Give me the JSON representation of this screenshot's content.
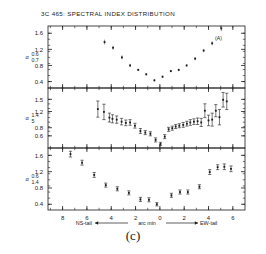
{
  "figure": {
    "title": "3C 465: SPECTRAL INDEX DISTRIBUTION",
    "caption": "(c)",
    "panel_a_label": "(A)",
    "x_axis_caption_left": "NS-tail",
    "x_axis_caption_center": "arc min",
    "x_axis_caption_right": "EW-tail",
    "ink_color": "#1b1b1b",
    "background_color": "#ffffff"
  },
  "chart_data": [
    {
      "type": "scatter",
      "panel": "A",
      "title": "3C 465: SPECTRAL INDEX DISTRIBUTION",
      "annotation": "(A)",
      "ylabel_main": "α",
      "ylabel_sub_top": "0.6",
      "ylabel_sub_bottom": "0.7",
      "xlabel": "arc min",
      "xlim": [
        9.2,
        -7.0
      ],
      "ylim": [
        0.24,
        1.78
      ],
      "yticks": [
        0.4,
        0.8,
        1.2,
        1.6
      ],
      "ytick_labels": [
        "0.4",
        "0.8",
        "1.2",
        "1.6"
      ],
      "xticks": [
        8,
        6,
        4,
        2,
        0,
        -2,
        -4,
        -6
      ],
      "xtick_labels": [
        "8",
        "6",
        "4",
        "2",
        "0",
        "2",
        "4",
        "6"
      ],
      "grid": false,
      "errorbars": false,
      "x": [
        4.55,
        3.85,
        3.12,
        2.45,
        1.78,
        1.12,
        0.45,
        -0.22,
        -0.9,
        -1.55,
        -2.2,
        -2.9,
        -3.6,
        -4.3,
        -5.05
      ],
      "y": [
        1.38,
        1.24,
        1.0,
        0.8,
        0.69,
        0.58,
        0.43,
        0.52,
        0.66,
        0.69,
        0.8,
        0.97,
        1.17,
        1.35,
        1.72
      ],
      "yerr": [
        0.06,
        0.05,
        0.05,
        0.04,
        0.03,
        0.03,
        0.03,
        0.03,
        0.03,
        0.03,
        0.03,
        0.04,
        0.04,
        0.05,
        0.07
      ]
    },
    {
      "type": "scatter",
      "panel": "B",
      "ylabel_main": "α",
      "ylabel_sub_top": "1.4",
      "ylabel_sub_bottom": "5",
      "xlabel": "arc min",
      "xlim": [
        9.2,
        -7.0
      ],
      "ylim": [
        0.3,
        1.78
      ],
      "yticks": [
        0.6,
        0.8,
        1.2,
        1.5
      ],
      "ytick_labels": [
        "0.6",
        "0.8",
        "1.2",
        "1.5"
      ],
      "xticks": [
        8,
        6,
        4,
        2,
        0,
        -2,
        -4,
        -6
      ],
      "xtick_labels": [
        "8",
        "6",
        "4",
        "2",
        "0",
        "2",
        "4",
        "6"
      ],
      "grid": false,
      "errorbars": true,
      "x": [
        5.1,
        4.6,
        4.15,
        3.9,
        3.55,
        3.15,
        2.8,
        2.45,
        2.05,
        1.6,
        1.2,
        0.78,
        0.35,
        -0.05,
        -0.4,
        -0.72,
        -1.02,
        -1.3,
        -1.6,
        -1.92,
        -2.22,
        -2.5,
        -2.8,
        -3.1,
        -3.4,
        -3.7,
        -4.0,
        -4.3,
        -4.6,
        -4.9,
        -5.2,
        -5.5
      ],
      "y": [
        1.26,
        1.19,
        1.05,
        1.02,
        1.0,
        0.95,
        0.92,
        0.93,
        0.85,
        0.72,
        0.68,
        0.65,
        0.5,
        0.4,
        0.58,
        0.76,
        0.79,
        0.83,
        0.85,
        0.87,
        0.9,
        0.93,
        0.95,
        0.96,
        0.93,
        1.22,
        0.98,
        1.0,
        1.22,
        1.06,
        1.49,
        1.45
      ],
      "yerr": [
        0.2,
        0.19,
        0.11,
        0.1,
        0.09,
        0.08,
        0.07,
        0.07,
        0.06,
        0.06,
        0.05,
        0.05,
        0.05,
        0.04,
        0.05,
        0.05,
        0.05,
        0.05,
        0.05,
        0.06,
        0.06,
        0.07,
        0.07,
        0.08,
        0.1,
        0.17,
        0.13,
        0.16,
        0.15,
        0.19,
        0.18,
        0.2
      ]
    },
    {
      "type": "scatter",
      "panel": "C",
      "ylabel_main": "α",
      "ylabel_sub_top": "0.6",
      "ylabel_sub_bottom": "1.4",
      "xlabel": "arc min",
      "xlim": [
        9.2,
        -7.0
      ],
      "ylim": [
        0.26,
        1.78
      ],
      "yticks": [
        0.4,
        0.8,
        1.2,
        1.6
      ],
      "ytick_labels": [
        "0.4",
        "0.8",
        "1.2",
        "1.6"
      ],
      "xticks": [
        8,
        6,
        4,
        2,
        0,
        -2,
        -4,
        -6
      ],
      "xtick_labels": [
        "8",
        "6",
        "4",
        "2",
        "0",
        "2",
        "4",
        "6"
      ],
      "grid": false,
      "errorbars": true,
      "x": [
        7.35,
        6.4,
        5.4,
        4.45,
        3.5,
        2.55,
        1.6,
        0.9,
        0.25,
        -0.95,
        -1.65,
        -2.3,
        -3.25,
        -4.1,
        -4.75,
        -5.3,
        -5.85
      ],
      "y": [
        1.63,
        1.42,
        1.12,
        0.87,
        0.78,
        0.68,
        0.52,
        0.51,
        0.4,
        0.62,
        0.7,
        0.7,
        0.83,
        1.19,
        1.31,
        1.32,
        1.27
      ],
      "yerr": [
        0.07,
        0.06,
        0.06,
        0.05,
        0.05,
        0.05,
        0.05,
        0.05,
        0.04,
        0.05,
        0.05,
        0.05,
        0.05,
        0.06,
        0.06,
        0.07,
        0.07
      ]
    }
  ]
}
